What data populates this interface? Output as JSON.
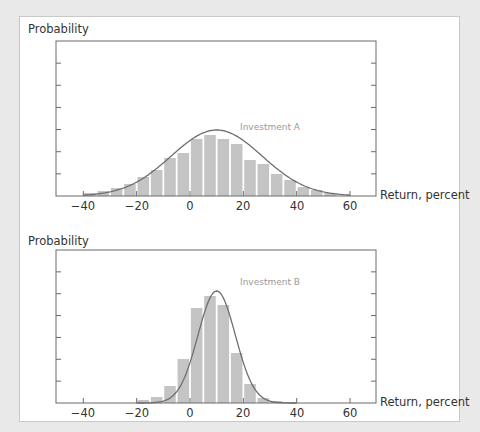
{
  "chart_data": [
    {
      "type": "bar",
      "title": "Investment A",
      "ylabel": "Probability",
      "xlabel": "Return, percent",
      "xticks": [
        -40,
        -20,
        0,
        20,
        40,
        60
      ],
      "xlim": [
        -50,
        70
      ],
      "bar_width": 5,
      "categories": [
        -37.5,
        -32.5,
        -27.5,
        -22.5,
        -17.5,
        -12.5,
        -7.5,
        -2.5,
        2.5,
        7.5,
        12.5,
        17.5,
        22.5,
        27.5,
        32.5,
        37.5,
        42.5,
        47.5,
        52.5
      ],
      "values": [
        3,
        5,
        8,
        12,
        19,
        26,
        38,
        43,
        57,
        61,
        57,
        52,
        36,
        32,
        22,
        16,
        9,
        6,
        3
      ],
      "curve": {
        "type": "normal",
        "mean": 10,
        "sd": 17,
        "peak": 66
      },
      "series_label": "Investment A",
      "grid": false,
      "y_ticks_unlabeled": 6
    },
    {
      "type": "bar",
      "title": "Investment B",
      "ylabel": "Probability",
      "xlabel": "Return, percent",
      "xticks": [
        -40,
        -20,
        0,
        20,
        40,
        60
      ],
      "xlim": [
        -50,
        70
      ],
      "bar_width": 5,
      "categories": [
        -17.5,
        -12.5,
        -7.5,
        -2.5,
        2.5,
        7.5,
        12.5,
        17.5,
        22.5,
        27.5,
        32.5
      ],
      "values": [
        3,
        6,
        17,
        44,
        95,
        107,
        98,
        50,
        19,
        5,
        2
      ],
      "curve": {
        "type": "normal",
        "mean": 10,
        "sd": 7,
        "peak": 112
      },
      "series_label": "Investment B",
      "grid": false,
      "y_ticks_unlabeled": 6
    }
  ],
  "labels": {
    "top_ylabel": "Probability",
    "top_xlabel": "Return, percent",
    "top_series": "Investment A",
    "bottom_ylabel": "Probability",
    "bottom_xlabel": "Return, percent",
    "bottom_series": "Investment B",
    "ticks": [
      "−40",
      "−20",
      "0",
      "20",
      "40",
      "60"
    ]
  },
  "colors": {
    "bar": "#c4c4c4",
    "curve": "#6e6e6e",
    "axis": "#6a6a6a",
    "series_label": "#9a9a9a"
  }
}
